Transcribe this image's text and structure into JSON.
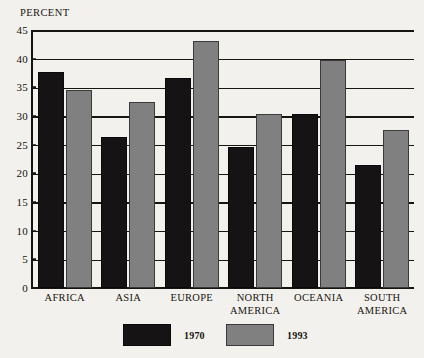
{
  "chart_data": {
    "type": "bar",
    "title": "",
    "subtitle": "",
    "xlabel": "",
    "ylabel": "PERCENT",
    "ylim": [
      0,
      45
    ],
    "yticks": [
      0,
      5,
      10,
      15,
      20,
      25,
      30,
      35,
      40,
      45
    ],
    "ytick_labels": [
      "0",
      "5",
      "10",
      "15",
      "20",
      "25",
      "30",
      "35",
      "40",
      "45"
    ],
    "grid": true,
    "grid_axis": "y",
    "legend_position": "bottom",
    "categories": [
      "Africa",
      "Asia",
      "Europe",
      "North America",
      "Oceania",
      "South America"
    ],
    "category_label_lines": [
      [
        "Africa"
      ],
      [
        "Asia"
      ],
      [
        "Europe"
      ],
      [
        "North",
        "America"
      ],
      [
        "Oceania"
      ],
      [
        "South",
        "America"
      ]
    ],
    "series": [
      {
        "name": "1970",
        "color": "#151313",
        "values": [
          37.7,
          26.4,
          36.6,
          24.6,
          30.3,
          21.5
        ]
      },
      {
        "name": "1993",
        "color": "#808080",
        "values": [
          34.6,
          32.5,
          43.1,
          30.3,
          39.7,
          27.5
        ]
      }
    ]
  },
  "colors": {
    "background": "#f3f1ed",
    "ink": "#17150f",
    "series_1970": "#151313",
    "series_1993": "#808080"
  }
}
